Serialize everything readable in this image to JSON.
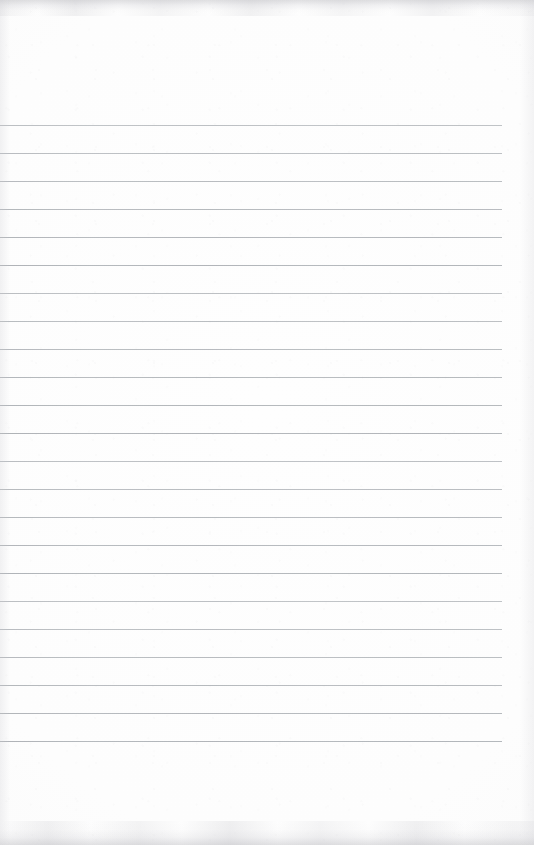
{
  "document": {
    "kind": "scanned-lined-notepad-page",
    "title": "Lined notepad page",
    "orientation": "portrait",
    "page_width": 534,
    "page_height": 845,
    "visible_text": "",
    "text_content_note": "Page is blank — no handwriting, printing or markings other than the pre-printed ruling.",
    "paper_color": "#fdfdfd",
    "background_color": "#ffffff"
  },
  "ruling": {
    "line_color": "#b4b8bc",
    "line_thickness_px": 1,
    "line_count": 23,
    "line_left_x": 0,
    "line_right_x": 502,
    "line_length_px": 502,
    "first_line_y": 125,
    "last_line_y": 741,
    "line_spacing_px": 28,
    "has_margin_rule": false,
    "line_y_positions": [
      125,
      153,
      181,
      209,
      237,
      265,
      293,
      321,
      349,
      377,
      405,
      433,
      461,
      489,
      517,
      545,
      573,
      601,
      629,
      657,
      685,
      713,
      741
    ]
  },
  "regions": {
    "header_label": "blank header area above first rule",
    "header_height_px": 125,
    "footer_label": "blank footer area below last rule",
    "footer_height_px": 103,
    "right_margin_label": "blank right margin beyond rule ends",
    "right_margin_width_px": 32
  },
  "scan_artifacts": {
    "top_edge_band": "mottled grey scan border",
    "bottom_edge_band": "mottled grey scan border",
    "left_edge_shading": "soft grey gradient",
    "right_edge_shading": "soft grey gradient",
    "grain": "faint paper speckle",
    "edge_color": "#c6c6ca"
  }
}
